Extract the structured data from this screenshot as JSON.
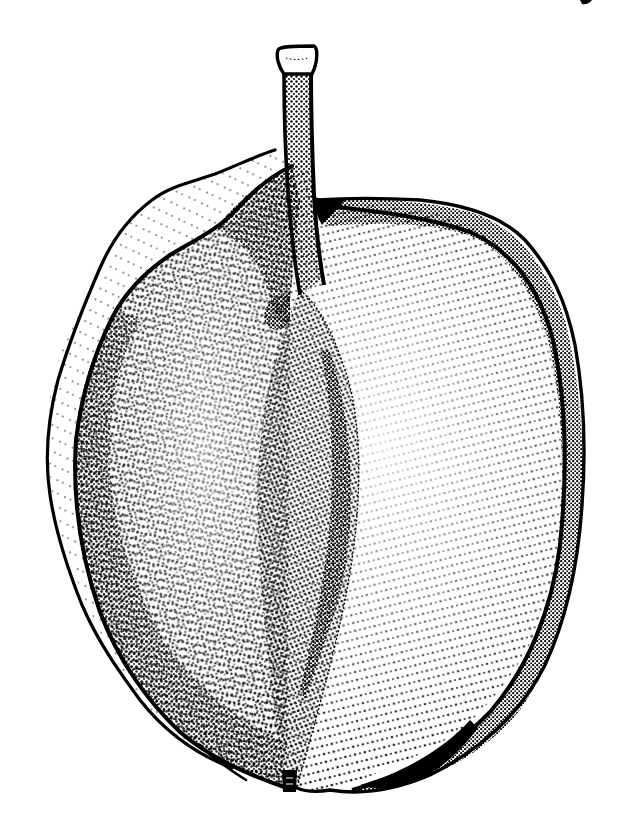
{
  "figure": {
    "subject": "Stipple illustration of a winged seed (samara) with stalk",
    "style": "black ink stipple on white",
    "colors": {
      "ink": "#000000",
      "paper": "#ffffff"
    },
    "parts": [
      {
        "id": "stalk",
        "label": "stalk with flat flared tip"
      },
      {
        "id": "wing-outer-left",
        "label": "outer wing margin (left)"
      },
      {
        "id": "wing-body",
        "label": "wing body with radiating stipple"
      },
      {
        "id": "rim-right",
        "label": "thickened stippled rim (right)"
      },
      {
        "id": "seed",
        "label": "central lens-shaped seed ridge"
      },
      {
        "id": "base-tip",
        "label": "basal tip"
      }
    ],
    "corner_mark": "small ink mark at top right"
  }
}
